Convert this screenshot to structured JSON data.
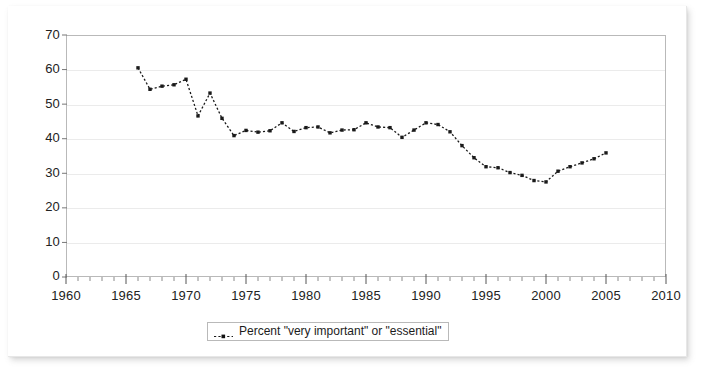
{
  "chart_data": {
    "type": "line",
    "title": "",
    "subtitle": "",
    "xlabel": "",
    "ylabel": "",
    "xlim": [
      1960,
      2010
    ],
    "ylim": [
      0,
      70
    ],
    "grid": true,
    "legend_position": "bottom-center",
    "x_ticks": [
      "1960",
      "1965",
      "1970",
      "1975",
      "1980",
      "1985",
      "1990",
      "1995",
      "2000",
      "2005",
      "2010"
    ],
    "x_tick_values": [
      1960,
      1965,
      1970,
      1975,
      1980,
      1985,
      1990,
      1995,
      2000,
      2005,
      2010
    ],
    "x_minor_tick_interval": 1,
    "y_ticks": [
      "0",
      "10",
      "20",
      "30",
      "40",
      "50",
      "60",
      "70"
    ],
    "y_tick_values": [
      0,
      10,
      20,
      30,
      40,
      50,
      60,
      70
    ],
    "series": [
      {
        "name": "Percent \"very important\" or \"essential\"",
        "line_style": "dotted",
        "marker": "square",
        "color": "#1a1a1a",
        "x": [
          1966,
          1967,
          1968,
          1969,
          1970,
          1971,
          1972,
          1973,
          1974,
          1975,
          1976,
          1977,
          1978,
          1979,
          1980,
          1981,
          1982,
          1983,
          1984,
          1985,
          1986,
          1987,
          1988,
          1989,
          1990,
          1991,
          1992,
          1993,
          1994,
          1995,
          1996,
          1997,
          1998,
          1999,
          2000,
          2001,
          2002,
          2003,
          2004,
          2005
        ],
        "values": [
          60.5,
          54.3,
          55.2,
          55.6,
          57.2,
          46.6,
          53.2,
          45.9,
          40.9,
          42.4,
          41.9,
          42.3,
          44.6,
          42.1,
          43.2,
          43.4,
          41.7,
          42.5,
          42.6,
          44.6,
          43.4,
          43.2,
          40.4,
          42.5,
          44.6,
          44.1,
          42.0,
          38.0,
          34.5,
          31.9,
          31.6,
          30.2,
          29.4,
          27.9,
          27.5,
          30.6,
          31.9,
          33.0,
          34.2,
          35.9
        ]
      }
    ]
  },
  "legend": {
    "label": "Percent \"very important\" or \"essential\"",
    "marker_icon": "dotted-line-square-marker-icon"
  }
}
